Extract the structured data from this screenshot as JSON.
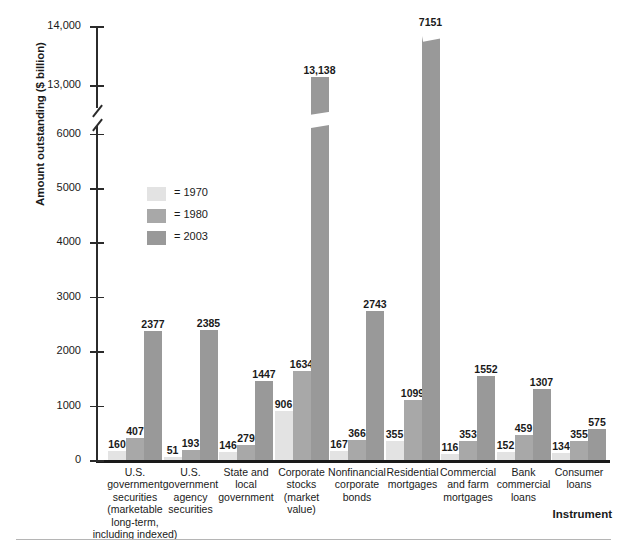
{
  "chart_data": {
    "type": "bar",
    "title": "",
    "xlabel": "Instrument",
    "ylabel": "Amount outstanding ($ billion)",
    "ylim": [
      0,
      14000
    ],
    "y_axis_break": {
      "from": 6000,
      "to": 13000
    },
    "grid": false,
    "legend_position": "inside-left",
    "categories": [
      "U.S. government securities (marketable long-term, including indexed)",
      "U.S. government agency securities",
      "State and local government",
      "Corporate stocks (market value)",
      "Nonfinancial corporate bonds",
      "Residential mortgages",
      "Commercial and farm mortgages",
      "Bank commercial loans",
      "Consumer loans"
    ],
    "series": [
      {
        "name": "1970",
        "color": "#e3e3e3",
        "values": [
          160,
          51,
          146,
          906,
          167,
          355,
          116,
          152,
          134
        ]
      },
      {
        "name": "1980",
        "color": "#a8a8a8",
        "values": [
          407,
          193,
          279,
          1634,
          366,
          1099,
          353,
          459,
          355
        ]
      },
      {
        "name": "2003",
        "color": "#999999",
        "values": [
          2377,
          2385,
          1447,
          13138,
          2743,
          7151,
          1552,
          1307,
          575
        ]
      }
    ],
    "value_labels": {
      "1970": [
        "160",
        "51",
        "146",
        "906",
        "167",
        "355",
        "116",
        "152",
        "134"
      ],
      "1980": [
        "407",
        "193",
        "279",
        "1634",
        "366",
        "1099",
        "353",
        "459",
        "355"
      ],
      "2003": [
        "2377",
        "2385",
        "1447",
        "13,138",
        "2743",
        "7151",
        "1552",
        "1307",
        "575"
      ]
    },
    "y_ticks": [
      "0",
      "1000",
      "2000",
      "3000",
      "4000",
      "5000",
      "6000",
      "13,000",
      "14,000"
    ]
  },
  "axes": {
    "y_title": "Amount outstanding ($ billion)",
    "x_title": "Instrument",
    "y_tick_labels": [
      {
        "text": "14,000"
      },
      {
        "text": "13,000"
      },
      {
        "text": "6000"
      },
      {
        "text": "5000"
      },
      {
        "text": "4000"
      },
      {
        "text": "3000"
      },
      {
        "text": "2000"
      },
      {
        "text": "1000"
      },
      {
        "text": "0"
      }
    ]
  },
  "legend": {
    "items": [
      {
        "label": "= 1970",
        "color": "#e3e3e3"
      },
      {
        "label": "= 1980",
        "color": "#a8a8a8"
      },
      {
        "label": "= 2003",
        "color": "#999999"
      }
    ]
  },
  "category_labels": [
    "U.S.\ngovernment\nsecurities\n(marketable\nlong-term,\nincluding indexed)",
    "U.S.\ngovernment\nagency\nsecurities",
    "State and\nlocal\ngovernment",
    "Corporate\nstocks\n(market\nvalue)",
    "Nonfinancial\ncorporate\nbonds",
    "Residential\nmortgages",
    "Commercial\nand farm\nmortgages",
    "Bank\ncommercial\nloans",
    "Consumer\nloans"
  ]
}
